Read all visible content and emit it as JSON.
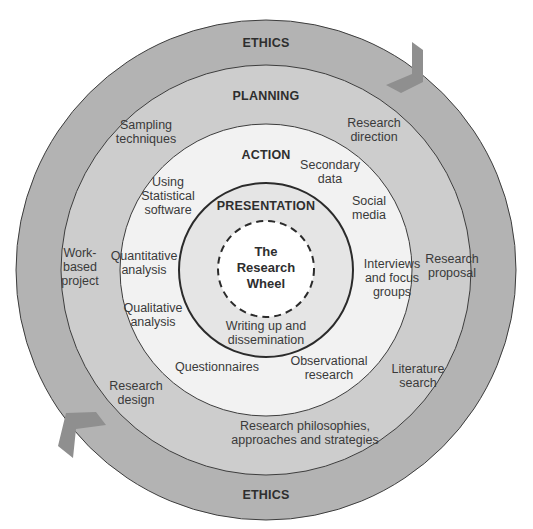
{
  "diagram": {
    "center": {
      "label": "The\nResearch\nWheel",
      "x": 266,
      "y": 270
    },
    "colors": {
      "ethics": "#b3b3b3",
      "planning": "#cdcdcd",
      "action": "#f2f2f2",
      "presentation": "#e5e5e5",
      "core": "#ffffff",
      "stroke": "#3d3d3d",
      "arrow": "#8f8f8f"
    },
    "rings": [
      {
        "id": "ethics",
        "title": "ETHICS",
        "outer_radius": 250
      },
      {
        "id": "planning",
        "title": "PLANNING",
        "outer_radius": 205
      },
      {
        "id": "action",
        "title": "ACTION",
        "outer_radius": 146
      },
      {
        "id": "presentation",
        "title": "PRESENTATION",
        "outer_radius": 87
      },
      {
        "id": "core",
        "title": "The Research Wheel",
        "outer_radius": 48,
        "dashed": true
      }
    ],
    "ring_titles": {
      "ethics_top": "ETHICS",
      "ethics_bottom": "ETHICS",
      "planning": "PLANNING",
      "action": "ACTION",
      "presentation": "PRESENTATION"
    },
    "planning_items": [
      {
        "label": "Sampling\ntechniques",
        "x": 146,
        "y": 132
      },
      {
        "label": "Research\ndirection",
        "x": 374,
        "y": 130
      },
      {
        "label": "Work-\nbased\nproject",
        "x": 80,
        "y": 267
      },
      {
        "label": "Research\nproposal",
        "x": 452,
        "y": 266
      },
      {
        "label": "Research\ndesign",
        "x": 136,
        "y": 393
      },
      {
        "label": "Literature\nsearch",
        "x": 418,
        "y": 376
      },
      {
        "label": "Research philosophies,\napproaches and strategies",
        "x": 305,
        "y": 433
      }
    ],
    "action_items": [
      {
        "label": "Secondary\ndata",
        "x": 330,
        "y": 172
      },
      {
        "label": "Using\nStatistical\nsoftware",
        "x": 168,
        "y": 196
      },
      {
        "label": "Social\nmedia",
        "x": 369,
        "y": 208
      },
      {
        "label": "Quantitative\nanalysis",
        "x": 144,
        "y": 263
      },
      {
        "label": "Interviews\nand focus\ngroups",
        "x": 392,
        "y": 278
      },
      {
        "label": "Qualitative\nanalysis",
        "x": 153,
        "y": 315
      },
      {
        "label": "Questionnaires",
        "x": 217,
        "y": 367
      },
      {
        "label": "Observational\nresearch",
        "x": 329,
        "y": 368
      }
    ],
    "presentation_items": [
      {
        "label": "Writing up and\ndissemination",
        "x": 266,
        "y": 333
      }
    ],
    "arrows": [
      {
        "id": "arrow-top-right",
        "direction": "clockwise"
      },
      {
        "id": "arrow-bottom-left",
        "direction": "clockwise"
      }
    ]
  }
}
